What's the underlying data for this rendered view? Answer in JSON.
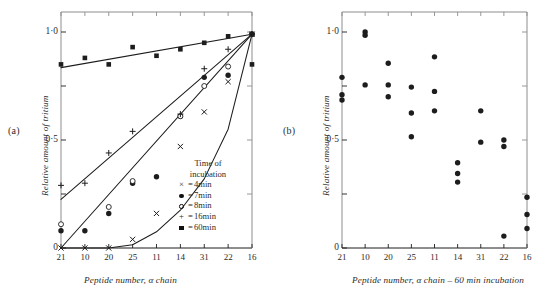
{
  "figure": {
    "panel_a_label": "(a)",
    "panel_b_label": "(b)"
  },
  "panel_a": {
    "ylabel": "Relative amount of tritium",
    "xlabel": "Peptide number, α chain",
    "yticks": [
      "1·0",
      "0·5",
      "0"
    ],
    "xticks": [
      "21",
      "10",
      "20",
      "25",
      "11",
      "14",
      "31",
      "22",
      "16"
    ],
    "legend": {
      "title_line1": "Time of",
      "title_line2": "incubation",
      "entries": [
        {
          "symbol": "x",
          "eq": "=",
          "label": "4min"
        },
        {
          "symbol": "filled-circle",
          "eq": "=",
          "label": "7min"
        },
        {
          "symbol": "open-circle",
          "eq": "=",
          "label": "8min"
        },
        {
          "symbol": "plus",
          "eq": "=",
          "label": "16min"
        },
        {
          "symbol": "filled-square",
          "eq": "=",
          "label": "60min"
        }
      ]
    }
  },
  "panel_b": {
    "ylabel": "Relative amount of tritium",
    "xlabel": "Peptide number, α chain – 60 min incubation",
    "yticks": [
      "1·0",
      "0·5",
      "0"
    ],
    "xticks": [
      "21",
      "10",
      "20",
      "25",
      "11",
      "14",
      "31",
      "22",
      "16"
    ]
  },
  "chart_data": [
    {
      "type": "scatter",
      "panel": "a",
      "title": "",
      "xlabel": "Peptide number, α chain",
      "ylabel": "Relative amount of tritium",
      "categories": [
        "21",
        "10",
        "20",
        "25",
        "11",
        "14",
        "31",
        "22",
        "16"
      ],
      "ylim": [
        0,
        1.05
      ],
      "yticks": [
        0,
        0.5,
        1.0
      ],
      "grid": false,
      "legend_position": "inside-bottom-right",
      "series": [
        {
          "name": "4min",
          "marker": "x",
          "values": [
            0.0,
            0.0,
            0.0,
            0.04,
            0.16,
            0.47,
            0.63,
            0.77,
            0.99
          ]
        },
        {
          "name": "7min",
          "marker": "filled-circle",
          "values": [
            0.08,
            0.08,
            0.16,
            0.3,
            0.33,
            0.61,
            0.79,
            0.8,
            0.99
          ]
        },
        {
          "name": "8min",
          "marker": "open-circle",
          "values": [
            0.11,
            null,
            0.19,
            0.31,
            null,
            0.61,
            0.75,
            0.84,
            0.99
          ]
        },
        {
          "name": "16min",
          "marker": "plus",
          "values": [
            0.29,
            0.3,
            0.44,
            0.54,
            null,
            0.62,
            0.83,
            0.92,
            0.99
          ]
        },
        {
          "name": "60min",
          "marker": "filled-square",
          "values": [
            0.85,
            0.88,
            0.85,
            0.93,
            0.89,
            0.92,
            0.95,
            0.98,
            0.99
          ]
        }
      ],
      "fitted_curves": [
        {
          "name": "60min-line",
          "x": [
            0,
            8
          ],
          "y": [
            0.835,
            0.99
          ]
        },
        {
          "name": "16min-line",
          "x": [
            0,
            8
          ],
          "y": [
            0.225,
            0.99
          ]
        },
        {
          "name": "8min-line",
          "x": [
            0,
            8
          ],
          "y": [
            0.0,
            0.99
          ]
        },
        {
          "name": "4min-curve",
          "x": [
            0,
            2,
            3,
            4,
            5,
            6,
            7,
            8
          ],
          "y": [
            0.0,
            0.0,
            0.015,
            0.075,
            0.175,
            0.32,
            0.55,
            0.99
          ]
        }
      ],
      "extra_markers": [
        {
          "series": "60min",
          "note": "point at right axis",
          "x_index": 8,
          "y": 0.85
        }
      ]
    },
    {
      "type": "scatter",
      "panel": "b",
      "title": "",
      "xlabel": "Peptide number, α chain – 60 min incubation",
      "ylabel": "Relative amount of tritium",
      "categories": [
        "21",
        "10",
        "20",
        "25",
        "11",
        "14",
        "31",
        "22",
        "16"
      ],
      "ylim": [
        0,
        1.05
      ],
      "yticks": [
        0,
        0.5,
        1.0
      ],
      "grid": false,
      "points": [
        {
          "x_index": 0,
          "y": 0.79
        },
        {
          "x_index": 0,
          "y": 0.71
        },
        {
          "x_index": 0,
          "y": 0.685
        },
        {
          "x_index": 1,
          "y": 1.0
        },
        {
          "x_index": 1,
          "y": 0.985
        },
        {
          "x_index": 1,
          "y": 0.755
        },
        {
          "x_index": 2,
          "y": 0.855
        },
        {
          "x_index": 2,
          "y": 0.755
        },
        {
          "x_index": 2,
          "y": 0.7
        },
        {
          "x_index": 3,
          "y": 0.745
        },
        {
          "x_index": 3,
          "y": 0.625
        },
        {
          "x_index": 3,
          "y": 0.515
        },
        {
          "x_index": 4,
          "y": 0.885
        },
        {
          "x_index": 4,
          "y": 0.725
        },
        {
          "x_index": 4,
          "y": 0.635
        },
        {
          "x_index": 5,
          "y": 0.395
        },
        {
          "x_index": 5,
          "y": 0.345
        },
        {
          "x_index": 5,
          "y": 0.305
        },
        {
          "x_index": 6,
          "y": 0.635
        },
        {
          "x_index": 6,
          "y": 0.49
        },
        {
          "x_index": 7,
          "y": 0.5
        },
        {
          "x_index": 7,
          "y": 0.47
        },
        {
          "x_index": 7,
          "y": 0.055
        },
        {
          "x_index": 8,
          "y": 0.235
        },
        {
          "x_index": 8,
          "y": 0.155
        },
        {
          "x_index": 8,
          "y": 0.09
        }
      ]
    }
  ]
}
